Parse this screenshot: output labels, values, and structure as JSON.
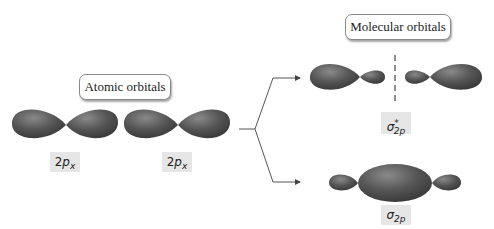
{
  "atomic": {
    "title": "Atomic orbitals",
    "orbitals": [
      {
        "label_main": "2",
        "label_italic": "p",
        "label_sub": "x"
      },
      {
        "label_main": "2",
        "label_italic": "p",
        "label_sub": "x"
      }
    ]
  },
  "molecular": {
    "title": "Molecular orbitals",
    "antibonding": {
      "symbol": "σ",
      "sub": "2p",
      "sup": "*"
    },
    "bonding": {
      "symbol": "σ",
      "sub": "2p"
    }
  },
  "colors": {
    "lobe": "#4a4a4a",
    "lobe_highlight": "#7a7a7a",
    "label_bg": "#e6e6e6",
    "line": "#555555"
  }
}
